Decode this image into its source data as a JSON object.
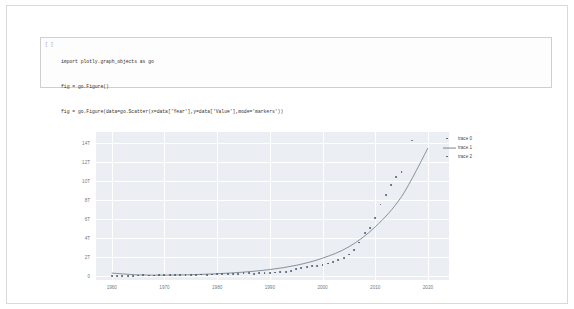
{
  "notebook": {
    "cell": {
      "prompt": "[ ]",
      "code_lines": [
        "import plotly.graph_objects as go",
        "fig = go.Figure()",
        "fig = go.Figure(data=go.Scatter(x=data['Year'],y=data['Value'],mode='markers'))",
        "fig.add_trace(go.Scatter(x=X_axis,y=y_quad_fit, mode='lines'))",
        "fig.add_trace(go.Scatter(x=predict_X,y=predict_y, mode='markers'))"
      ]
    }
  },
  "colors": {
    "plot_background": "#ebeef2",
    "grid": "#ffffff",
    "marker_trace0": "#4a5a6a",
    "line_trace1": "#7b8794",
    "marker_trace2": "#6b7785",
    "tick_text": "#6d7a86",
    "cell_border": "#cfcfcf",
    "page_border": "#d9d9d9"
  },
  "chart_data": {
    "type": "scatter",
    "title": "",
    "xlabel": "",
    "ylabel": "",
    "xlim": [
      1957,
      2024
    ],
    "ylim": [
      -400000000000,
      15200000000000
    ],
    "grid": true,
    "legend_position": "right",
    "x_ticks": [
      "1960",
      "1970",
      "1980",
      "1990",
      "2000",
      "2010",
      "2020"
    ],
    "x_tick_values": [
      1960,
      1970,
      1980,
      1990,
      2000,
      2010,
      2020
    ],
    "y_ticks": [
      "0",
      "2T",
      "4T",
      "6T",
      "8T",
      "10T",
      "12T",
      "14T"
    ],
    "y_tick_values": [
      0,
      2000000000000,
      4000000000000,
      6000000000000,
      8000000000000,
      10000000000000,
      12000000000000,
      14000000000000
    ],
    "series": [
      {
        "name": "trace 0",
        "mode": "markers",
        "color": "#4a5a6a",
        "x": [
          1960,
          1961,
          1962,
          1963,
          1964,
          1965,
          1966,
          1967,
          1968,
          1969,
          1970,
          1971,
          1972,
          1973,
          1974,
          1975,
          1976,
          1977,
          1978,
          1979,
          1980,
          1981,
          1982,
          1983,
          1984,
          1985,
          1986,
          1987,
          1988,
          1989,
          1990,
          1991,
          1992,
          1993,
          1994,
          1995,
          1996,
          1997,
          1998,
          1999,
          2000,
          2001,
          2002,
          2003,
          2004,
          2005,
          2006,
          2007,
          2008,
          2009,
          2010,
          2011,
          2012,
          2013,
          2014,
          2015
        ],
        "y": [
          60000000000,
          50000000000,
          47000000000,
          50000000000,
          59000000000,
          70000000000,
          76000000000,
          72000000000,
          70000000000,
          79000000000,
          92000000000,
          99000000000,
          113000000000,
          138000000000,
          144000000000,
          163000000000,
          153000000000,
          172000000000,
          148000000000,
          176000000000,
          191000000000,
          195000000000,
          205000000000,
          230000000000,
          259000000000,
          307000000000,
          297000000000,
          272000000000,
          312000000000,
          347000000000,
          360000000000,
          383000000000,
          426000000000,
          444000000000,
          564000000000,
          735000000000,
          863000000000,
          961000000000,
          1029000000000,
          1094000000000,
          1211000000000,
          1339000000000,
          1471000000000,
          1660000000000,
          1955000000000,
          2286000000000,
          2752000000000,
          3550000000000,
          4594000000000,
          5102000000000,
          6087000000000,
          7552000000000,
          8532000000000,
          9570000000000,
          10438000000000,
          11016000000000
        ]
      },
      {
        "name": "trace 1",
        "mode": "lines",
        "color": "#7b8794",
        "description": "quadratic fit curve over X_axis",
        "x": [
          1960,
          1965,
          1970,
          1975,
          1980,
          1985,
          1990,
          1995,
          2000,
          2005,
          2010,
          2015,
          2020
        ],
        "y": [
          330000000000,
          140000000000,
          110000000000,
          150000000000,
          260000000000,
          430000000000,
          700000000000,
          1150000000000,
          1900000000000,
          3100000000000,
          5200000000000,
          8400000000000,
          13500000000000
        ]
      },
      {
        "name": "trace 2",
        "mode": "markers",
        "color": "#6b7785",
        "description": "predicted values",
        "x": [
          2017
        ],
        "y": [
          14300000000000
        ]
      }
    ],
    "legend": [
      {
        "label": "trace 0",
        "symbol": "marker"
      },
      {
        "label": "trace 1",
        "symbol": "line"
      },
      {
        "label": "trace 2",
        "symbol": "marker"
      }
    ]
  }
}
